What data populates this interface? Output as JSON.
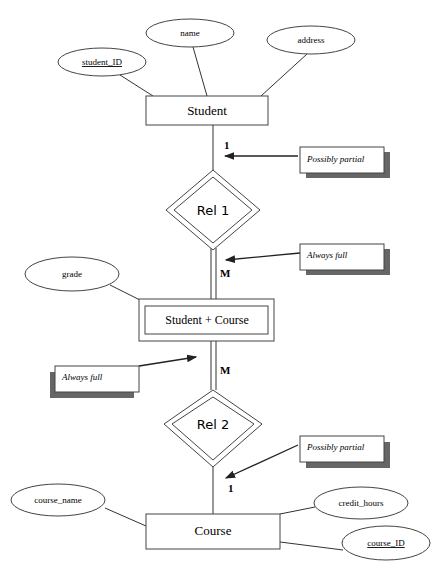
{
  "diagram": {
    "type": "ER diagram",
    "entities": {
      "student": "Student",
      "student_course": "Student + Course",
      "course": "Course"
    },
    "relationships": {
      "rel1": "Rel 1",
      "rel2": "Rel 2"
    },
    "attributes": {
      "student_id": "student_ID",
      "name": "name",
      "address": "address",
      "grade": "grade",
      "course_name": "course_name",
      "credit_hours": "credit_hours",
      "course_id": "course_ID"
    },
    "cardinalities": {
      "student_rel1": "1",
      "rel1_sc": "M",
      "sc_rel2": "M",
      "rel2_course": "1"
    },
    "notes": {
      "note1": "Possibly partial",
      "note2": "Always full",
      "note3": "Always full",
      "note4": "Possibly partial"
    }
  }
}
